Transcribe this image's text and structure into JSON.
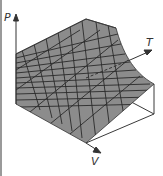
{
  "diagram": {
    "type": "3d-surface",
    "axes": {
      "p": {
        "label": "P"
      },
      "t": {
        "label": "T"
      },
      "v": {
        "label": "V"
      }
    },
    "colors": {
      "surface": "#8c8c8c",
      "grid": "#2a2a2a",
      "box": "#3a3a3a",
      "left_bar": "#9a9a9a"
    }
  }
}
